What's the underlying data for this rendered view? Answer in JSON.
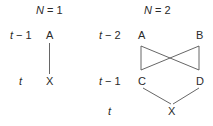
{
  "diagram": {
    "panels": [
      {
        "title_var": "N",
        "title_rest": " = 1",
        "row_labels": [
          {
            "var": "t",
            "rest": " − 1"
          },
          {
            "var": "t",
            "rest": ""
          }
        ],
        "nodes": {
          "A": "A",
          "X": "X"
        },
        "edges": [
          [
            "A",
            "X"
          ]
        ]
      },
      {
        "title_var": "N",
        "title_rest": " = 2",
        "row_labels": [
          {
            "var": "t",
            "rest": " − 2"
          },
          {
            "var": "t",
            "rest": " − 1"
          },
          {
            "var": "t",
            "rest": ""
          }
        ],
        "nodes": {
          "A": "A",
          "B": "B",
          "C": "C",
          "D": "D",
          "X": "X"
        },
        "edges": [
          [
            "A",
            "C"
          ],
          [
            "A",
            "D"
          ],
          [
            "B",
            "C"
          ],
          [
            "B",
            "D"
          ],
          [
            "C",
            "X"
          ],
          [
            "D",
            "X"
          ]
        ]
      }
    ],
    "line_color": "#555555"
  }
}
